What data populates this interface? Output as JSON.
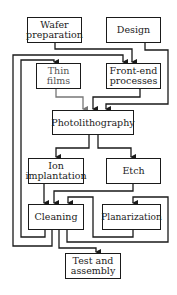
{
  "diagram": {
    "type": "flowchart",
    "nodes": {
      "wafer": "Wafer\npreparation",
      "design": "Design",
      "thin_films": "Thin films",
      "front_end": "Front-end\nprocesses",
      "photolithography": "Photolithography",
      "ion_implantation": "Ion\nimplantation",
      "etch": "Etch",
      "cleaning": "Cleaning",
      "planarization": "Planarization",
      "test_assembly": "Test and\nassembly"
    },
    "edges": [
      {
        "from": "Wafer preparation",
        "to": "Front-end processes"
      },
      {
        "from": "Design",
        "to": "Photolithography"
      },
      {
        "from": "Thin films",
        "to": "Photolithography"
      },
      {
        "from": "Front-end processes",
        "to": "Photolithography"
      },
      {
        "from": "Photolithography",
        "to": "Ion implantation"
      },
      {
        "from": "Photolithography",
        "to": "Etch"
      },
      {
        "from": "Ion implantation",
        "to": "Cleaning"
      },
      {
        "from": "Etch",
        "to": "Cleaning"
      },
      {
        "from": "Planarization",
        "to": "Cleaning"
      },
      {
        "from": "Cleaning",
        "to": "Planarization"
      },
      {
        "from": "Cleaning",
        "to": "Thin films"
      },
      {
        "from": "Cleaning",
        "to": "Front-end processes"
      },
      {
        "from": "Cleaning",
        "to": "Test and assembly"
      }
    ],
    "colors": {
      "line": "#1a1a1a",
      "line_muted": "#777777",
      "box_border": "#1a1a1a",
      "background": "#ffffff"
    }
  }
}
